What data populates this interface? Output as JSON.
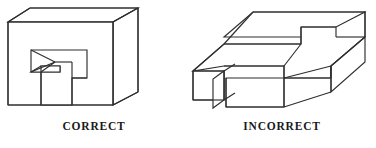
{
  "page": {
    "background_color": "#ffffff",
    "line_color": "#2e2e2e",
    "text_color": "#1a1a1a",
    "width": 376,
    "height": 148
  },
  "figures": [
    {
      "id": "correct-figure",
      "caption": "CORRECT",
      "icon_name": "isometric-block-with-notch",
      "description": "Tall rectangular block drawn in oblique projection with a stepped rectangular notch cut into its front face; the notch interior is rendered consistently so the solid reads as a physically possible object."
    },
    {
      "id": "incorrect-figure",
      "caption": "INCORRECT",
      "icon_name": "isometric-impossible-slab",
      "description": "Flat rectangular slab drawn in oblique projection with a slot and tongue; the interior edges contradict one another so the solid reads as a physically impossible object."
    }
  ]
}
